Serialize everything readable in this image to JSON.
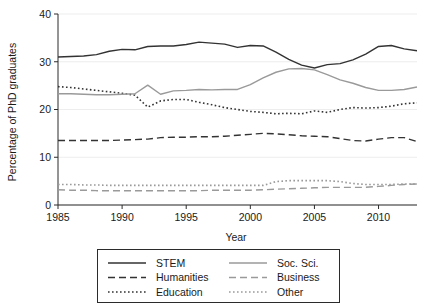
{
  "chart_data": {
    "type": "line",
    "title": "",
    "xlabel": "Year",
    "ylabel": "Percentage of PhD graduates",
    "xlim": [
      1985,
      2013
    ],
    "ylim": [
      0,
      40
    ],
    "xticks": [
      1985,
      1990,
      1995,
      2000,
      2005,
      2010
    ],
    "yticks": [
      0,
      10,
      20,
      30,
      40
    ],
    "grid": true,
    "legend_position": "below-plot",
    "x": [
      1985,
      1986,
      1987,
      1988,
      1989,
      1990,
      1991,
      1992,
      1993,
      1994,
      1995,
      1996,
      1997,
      1998,
      1999,
      2000,
      2001,
      2002,
      2003,
      2004,
      2005,
      2006,
      2007,
      2008,
      2009,
      2010,
      2011,
      2012,
      2013
    ],
    "series": [
      {
        "name": "STEM",
        "style": "solid",
        "color": "#333333",
        "values": [
          31.0,
          31.1,
          31.2,
          31.5,
          32.2,
          32.6,
          32.5,
          33.2,
          33.3,
          33.3,
          33.6,
          34.1,
          33.9,
          33.7,
          33.0,
          33.4,
          33.3,
          32.0,
          30.5,
          29.3,
          28.7,
          29.4,
          29.6,
          30.4,
          31.6,
          33.2,
          33.4,
          32.7,
          32.3
        ]
      },
      {
        "name": "Humanities",
        "style": "dashed",
        "color": "#333333",
        "values": [
          13.5,
          13.5,
          13.5,
          13.5,
          13.5,
          13.6,
          13.7,
          13.8,
          14.1,
          14.2,
          14.2,
          14.3,
          14.3,
          14.4,
          14.6,
          14.8,
          15.0,
          14.9,
          14.7,
          14.5,
          14.4,
          14.3,
          13.9,
          13.5,
          13.4,
          13.8,
          14.1,
          14.1,
          13.3
        ]
      },
      {
        "name": "Education",
        "style": "dotted",
        "color": "#333333",
        "values": [
          24.8,
          24.6,
          24.3,
          24.0,
          23.7,
          23.4,
          23.0,
          20.5,
          21.8,
          22.1,
          22.1,
          21.5,
          21.0,
          20.4,
          20.0,
          19.6,
          19.4,
          19.1,
          19.2,
          19.1,
          19.7,
          19.4,
          20.0,
          20.4,
          20.3,
          20.4,
          20.7,
          21.2,
          21.4
        ]
      },
      {
        "name": "Soc. Sci.",
        "style": "solid",
        "color": "#9a9a9a",
        "values": [
          23.3,
          23.3,
          23.2,
          23.1,
          23.1,
          23.2,
          23.3,
          25.1,
          23.2,
          23.9,
          24.0,
          24.2,
          24.1,
          24.2,
          24.2,
          25.2,
          26.6,
          27.8,
          28.5,
          28.6,
          28.3,
          27.3,
          26.2,
          25.5,
          24.6,
          24.0,
          24.0,
          24.2,
          24.7
        ]
      },
      {
        "name": "Business",
        "style": "dashed",
        "color": "#9a9a9a",
        "values": [
          3.2,
          3.1,
          3.1,
          3.0,
          3.0,
          3.0,
          3.0,
          3.0,
          3.0,
          3.0,
          3.0,
          3.0,
          3.1,
          3.1,
          3.1,
          3.1,
          3.2,
          3.3,
          3.4,
          3.5,
          3.6,
          3.7,
          3.7,
          3.7,
          3.7,
          3.9,
          4.1,
          4.3,
          4.4
        ]
      },
      {
        "name": "Other",
        "style": "dotted",
        "color": "#9a9a9a",
        "values": [
          4.3,
          4.3,
          4.2,
          4.2,
          4.1,
          4.1,
          4.1,
          4.1,
          4.1,
          4.1,
          4.1,
          4.1,
          4.1,
          4.1,
          4.1,
          4.1,
          4.1,
          4.9,
          5.1,
          5.1,
          5.1,
          5.1,
          4.9,
          4.5,
          4.3,
          4.3,
          4.3,
          4.4,
          4.4
        ]
      }
    ]
  },
  "axis": {
    "ylabel": "Percentage of PhD graduates",
    "xlabel": "Year",
    "ytick_labels": [
      "0",
      "10",
      "20",
      "30",
      "40"
    ],
    "xtick_labels": [
      "1985",
      "1990",
      "1995",
      "2000",
      "2005",
      "2010"
    ]
  },
  "legend": {
    "entries": [
      {
        "label": "STEM",
        "style": "solid",
        "color": "#333333"
      },
      {
        "label": "Soc. Sci.",
        "style": "solid",
        "color": "#9a9a9a"
      },
      {
        "label": "Humanities",
        "style": "dashed",
        "color": "#333333"
      },
      {
        "label": "Business",
        "style": "dashed",
        "color": "#9a9a9a"
      },
      {
        "label": "Education",
        "style": "dotted",
        "color": "#333333"
      },
      {
        "label": "Other",
        "style": "dotted",
        "color": "#9a9a9a"
      }
    ]
  },
  "caption": {
    "text": ""
  }
}
